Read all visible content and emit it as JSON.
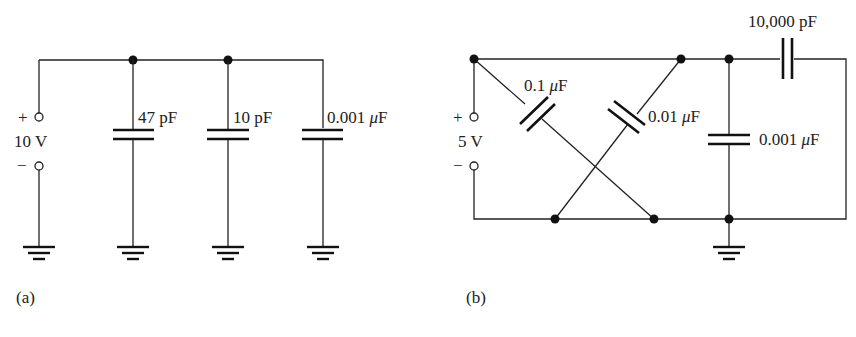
{
  "circuit_a": {
    "caption": "(a)",
    "source": {
      "plus": "+",
      "minus": "−",
      "value": "10 V"
    },
    "capacitors": [
      {
        "value": "47",
        "unit": "pF"
      },
      {
        "value": "10",
        "unit": "pF"
      },
      {
        "value": "0.001",
        "mu": "μ",
        "unit": "F"
      }
    ]
  },
  "circuit_b": {
    "caption": "(b)",
    "source": {
      "plus": "+",
      "minus": "−",
      "value": "5 V"
    },
    "capacitors": [
      {
        "value": "0.1",
        "mu": "μ",
        "unit": "F"
      },
      {
        "value": "0.01",
        "mu": "μ",
        "unit": "F"
      },
      {
        "value": "0.001",
        "mu": "μ",
        "unit": "F"
      },
      {
        "value": "10,000",
        "unit": "pF"
      }
    ]
  },
  "colors": {
    "line": "#222222",
    "background": "#ffffff"
  }
}
